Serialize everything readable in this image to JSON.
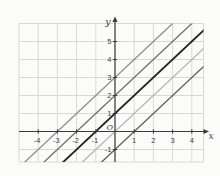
{
  "figure": {
    "background": "#fbfbf9"
  },
  "chart_data": {
    "type": "line",
    "title": "",
    "xlabel": "x",
    "ylabel": "y",
    "origin_label": "O",
    "xlim": [
      -5,
      4.6
    ],
    "ylim": [
      -1.7,
      6
    ],
    "grid": true,
    "x_tick_values": [
      -4,
      -3,
      -2,
      -1,
      1,
      2,
      3,
      4
    ],
    "y_tick_values": [
      -1,
      1,
      2,
      3,
      4,
      5
    ],
    "series": [
      {
        "name": "y = x + 3",
        "slope": 1,
        "intercept": 3,
        "color": "#8d8d8d",
        "width": 1.3
      },
      {
        "name": "y = x + 2",
        "slope": 1,
        "intercept": 2,
        "color": "#6e6e6e",
        "width": 1.3
      },
      {
        "name": "y = x + 1",
        "slope": 1,
        "intercept": 1,
        "color": "#212121",
        "width": 1.8
      },
      {
        "name": "y = x",
        "slope": 1,
        "intercept": 0,
        "color": "#b5b5b3",
        "width": 1.3
      },
      {
        "name": "y = x - 1",
        "slope": 1,
        "intercept": -1,
        "color": "#5c5c5c",
        "width": 1.3
      }
    ],
    "colors": {
      "grid": "#d9d9d4",
      "axis": "#3b3b3b",
      "tick_text": "#3f3f3f"
    }
  }
}
